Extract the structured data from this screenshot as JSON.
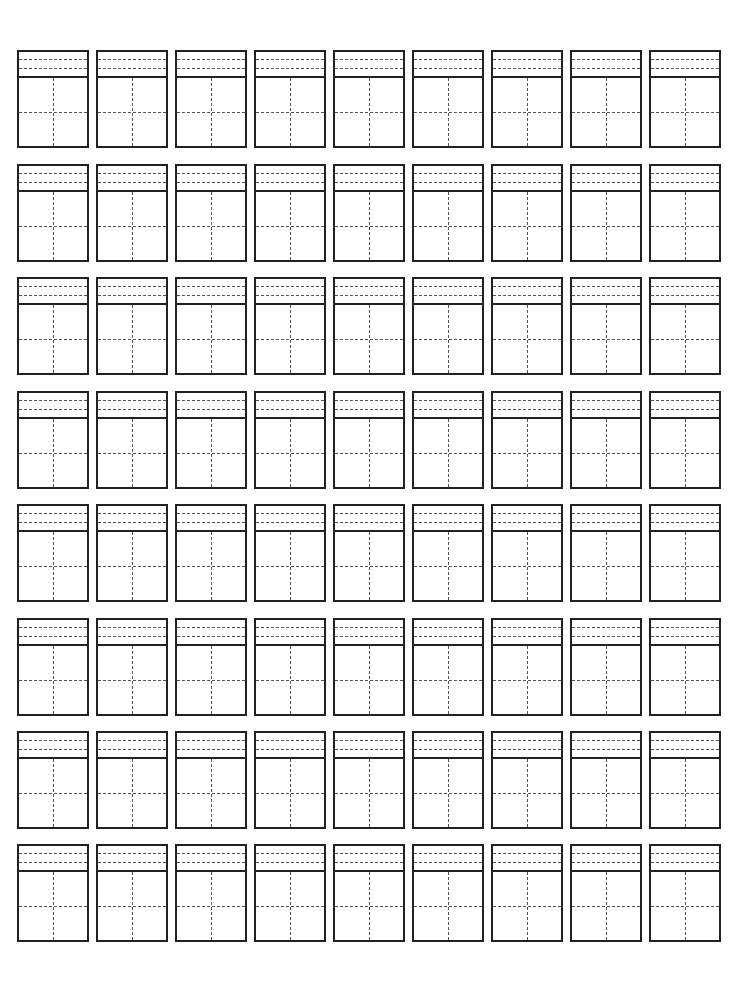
{
  "worksheet": {
    "type": "pinyin-hanzi-practice-grid",
    "rows": 8,
    "columns": 9,
    "cell_width": 72,
    "cell_height": 98,
    "column_lefts": [
      17,
      96,
      175,
      254,
      333,
      412,
      491,
      570,
      649
    ],
    "row_tops": [
      50,
      164,
      277,
      391,
      504,
      618,
      731,
      844
    ],
    "line_color": "#222222",
    "guide_color": "#555555",
    "background": "#ffffff"
  }
}
